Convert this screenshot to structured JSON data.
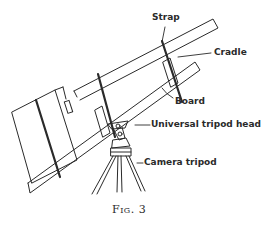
{
  "figure": {
    "caption": "Fig. 3",
    "labels": {
      "strap": "Strap",
      "cradle": "Cradle",
      "board": "Board",
      "tripod_head": "Universal tripod head",
      "camera_tripod": "Camera tripod"
    },
    "colors": {
      "ink": "#2a2a2a",
      "background": "#ffffff"
    }
  }
}
